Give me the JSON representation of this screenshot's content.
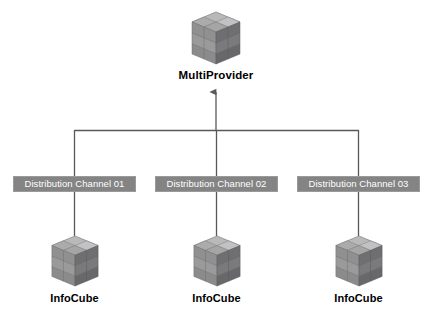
{
  "diagram": {
    "title_node": {
      "label": "MultiProvider",
      "icon": "cube-icon"
    },
    "channels": [
      {
        "label": "Distribution Channel 01"
      },
      {
        "label": "Distribution Channel 02"
      },
      {
        "label": "Distribution Channel 03"
      }
    ],
    "providers": [
      {
        "label": "InfoCube",
        "icon": "cube-icon"
      },
      {
        "label": "InfoCube",
        "icon": "cube-icon"
      },
      {
        "label": "InfoCube",
        "icon": "cube-icon"
      }
    ],
    "colors": {
      "background": "#ffffff",
      "channel_box_fill": "#848484",
      "channel_box_text": "#ffffff",
      "line": "#58585a",
      "label_text": "#000000",
      "cube_top": "#b4b4b4",
      "cube_left": "#8e8e8e",
      "cube_right": "#6e6e70"
    }
  }
}
